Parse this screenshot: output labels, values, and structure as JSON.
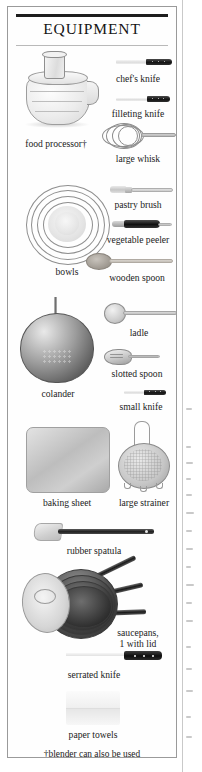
{
  "panel": {
    "title": "EQUIPMENT",
    "footnote": "†blender can also be used"
  },
  "items": [
    {
      "name": "food-processor",
      "label": "food processor†",
      "art": "food-processor"
    },
    {
      "name": "chefs-knife",
      "label": "chef's knife",
      "art": "knife"
    },
    {
      "name": "filleting-knife",
      "label": "filleting knife",
      "art": "knife"
    },
    {
      "name": "large-whisk",
      "label": "large whisk",
      "art": "whisk"
    },
    {
      "name": "bowls",
      "label": "bowls",
      "art": "bowls"
    },
    {
      "name": "pastry-brush",
      "label": "pastry brush",
      "art": "pastry-brush"
    },
    {
      "name": "vegetable-peeler",
      "label": "vegetable peeler",
      "art": "peeler"
    },
    {
      "name": "wooden-spoon",
      "label": "wooden spoon",
      "art": "wooden-spoon"
    },
    {
      "name": "ladle",
      "label": "ladle",
      "art": "ladle"
    },
    {
      "name": "slotted-spoon",
      "label": "slotted spoon",
      "art": "slotted-spoon"
    },
    {
      "name": "colander",
      "label": "colander",
      "art": "colander"
    },
    {
      "name": "small-knife",
      "label": "small knife",
      "art": "knife"
    },
    {
      "name": "baking-sheet",
      "label": "baking sheet",
      "art": "baking-sheet"
    },
    {
      "name": "large-strainer",
      "label": "large strainer",
      "art": "strainer"
    },
    {
      "name": "rubber-spatula",
      "label": "rubber spatula",
      "art": "spatula"
    },
    {
      "name": "saucepans",
      "label": "saucepans,\n1 with lid",
      "art": "saucepans"
    },
    {
      "name": "serrated-knife",
      "label": "serrated knife",
      "art": "serrated-knife"
    },
    {
      "name": "paper-towels",
      "label": "paper towels",
      "art": "paper-towels"
    }
  ],
  "labels": {
    "food_processor": "food processor†",
    "chefs_knife": "chef's knife",
    "filleting_knife": "filleting knife",
    "large_whisk": "large whisk",
    "bowls": "bowls",
    "pastry_brush": "pastry brush",
    "vegetable_peeler": "vegetable peeler",
    "wooden_spoon": "wooden spoon",
    "ladle": "ladle",
    "slotted_spoon": "slotted spoon",
    "colander": "colander",
    "small_knife": "small knife",
    "baking_sheet": "baking sheet",
    "large_strainer": "large strainer",
    "rubber_spatula": "rubber spatula",
    "saucepans_line1": "saucepans,",
    "saucepans_line2": "1 with lid",
    "serrated_knife": "serrated knife",
    "paper_towels": "paper towels"
  },
  "colors": {
    "page_background": "#ffffff",
    "panel_border": "#9a9a9a",
    "rule_dark": "#1d1d1d",
    "rule_light": "#b9b9b9",
    "text": "#1b1b1b",
    "knife_handle": "#131313",
    "metal_light": "#e9e9e9",
    "metal_dark": "#5c5c5c"
  }
}
